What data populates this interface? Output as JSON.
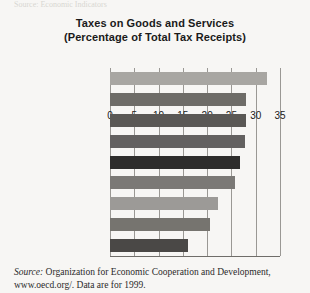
{
  "figure": {
    "top_bleed_text": "Source: Economic Indicators",
    "background_color": "#f7f6f4"
  },
  "chart_data": {
    "type": "bar",
    "orientation": "horizontal",
    "title": "Taxes on Goods and Services",
    "subtitle": "(Percentage of Total Tax Receipts)",
    "xlabel": "",
    "ylabel": "",
    "xlim": [
      0,
      35
    ],
    "xticks": [
      0,
      5,
      10,
      15,
      20,
      25,
      30,
      35
    ],
    "xtick_labels": [
      "0",
      "5",
      "10",
      "15",
      "20",
      "25",
      "30",
      "35"
    ],
    "grid": true,
    "grid_axis": "x",
    "legend": false,
    "categories": [
      "United Kingdom",
      "Netherlands",
      "Germany",
      "Italy",
      "France",
      "Canada",
      "Sweden",
      "Japan",
      "United States"
    ],
    "values": [
      32.3,
      28.0,
      28.0,
      27.8,
      26.8,
      25.7,
      22.2,
      20.6,
      16.0
    ],
    "bar_colors": [
      "#a8a6a2",
      "#6e6c68",
      "#5a5855",
      "#636160",
      "#2e2d2c",
      "#7b7976",
      "#9c9a97",
      "#76746f",
      "#4a4846"
    ]
  },
  "source": {
    "label": "Source:",
    "line1": " Organization for Economic Cooperation and Development,",
    "line2": "www.oecd.org/. Data are for 1999."
  }
}
